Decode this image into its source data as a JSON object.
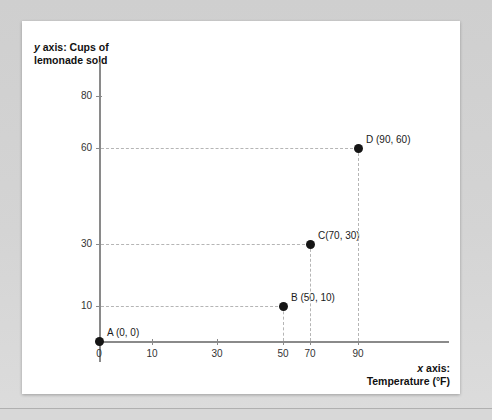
{
  "chart_data": {
    "type": "scatter",
    "title": "",
    "xlabel": "x axis: Temperature (°F)",
    "ylabel": "y axis: Cups of lemonade sold",
    "xlabel_var": "x",
    "xlabel_rest": " axis:",
    "xlabel_line2": "Temperature (°F)",
    "ylabel_var": "y",
    "ylabel_rest": " axis: Cups of",
    "ylabel_line2": "lemonade sold",
    "xlim": [
      0,
      100
    ],
    "ylim": [
      0,
      90
    ],
    "xticks": [
      0,
      10,
      30,
      50,
      70,
      90
    ],
    "yticks": [
      10,
      30,
      60,
      80
    ],
    "grid": false,
    "guides": "dashed lines from each point to both axes",
    "legend": "none",
    "points": [
      {
        "name": "A",
        "x": 0,
        "y": 0,
        "label": "A (0, 0)"
      },
      {
        "name": "B",
        "x": 50,
        "y": 10,
        "label": "B (50, 10)"
      },
      {
        "name": "C",
        "x": 70,
        "y": 30,
        "label": "C(70, 30)"
      },
      {
        "name": "D",
        "x": 90,
        "y": 60,
        "label": "D (90, 60)"
      }
    ]
  },
  "colors": {
    "point": "#151515",
    "axis": "#8a8a8a",
    "guide": "#b5b5b5",
    "panel": "#ffffff",
    "frame": "#d4d4d4"
  }
}
